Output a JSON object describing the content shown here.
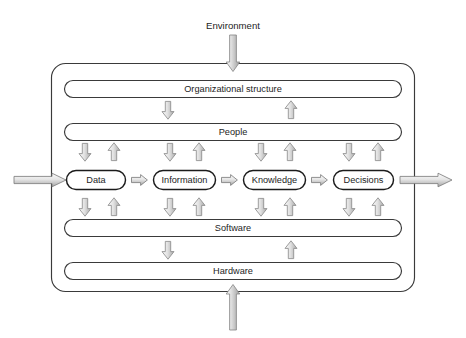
{
  "diagram": {
    "environment_label": "Environment",
    "layers": [
      {
        "id": "organizational-structure",
        "label": "Organizational structure"
      },
      {
        "id": "people",
        "label": "People"
      },
      {
        "id": "software",
        "label": "Software"
      },
      {
        "id": "hardware",
        "label": "Hardware"
      }
    ],
    "chain": [
      {
        "id": "data",
        "label": "Data"
      },
      {
        "id": "information",
        "label": "Information"
      },
      {
        "id": "knowledge",
        "label": "Knowledge"
      },
      {
        "id": "decisions",
        "label": "Decisions"
      }
    ],
    "flows": {
      "environment_in": "environment-input-arrow",
      "environment_out": "environment-output-arrow",
      "bottom_in": "bottom-input-arrow",
      "top_in": "top-input-arrow"
    },
    "icons": {
      "arrow_down": "arrow-down-icon",
      "arrow_up": "arrow-up-icon",
      "arrow_right": "arrow-right-icon"
    },
    "colors": {
      "background": "#ffffff",
      "outline": "#3a3a3a",
      "node_outline": "#1b1b1b",
      "arrow_outline": "#8d8d8d",
      "arrow_fill_light": "#f2f2f2",
      "arrow_fill_dark": "#b4b4b4",
      "text": "#1d1d1d"
    }
  }
}
